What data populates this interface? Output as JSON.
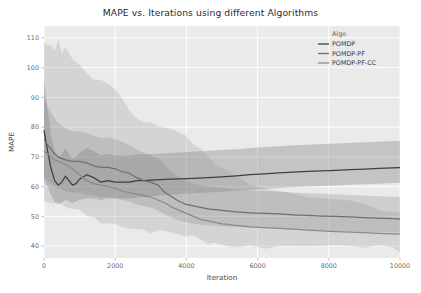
{
  "chart_data": {
    "type": "line",
    "title": "MAPE vs. Iterations using different Algorithms",
    "xlabel": "Iteration",
    "ylabel": "MAPE",
    "xlim": [
      0,
      10000
    ],
    "ylim": [
      36,
      114
    ],
    "xticks": [
      0,
      2000,
      4000,
      6000,
      8000,
      10000
    ],
    "xtick_labels": [
      "0",
      "2000",
      "4000",
      "6000",
      "8000",
      "10000"
    ],
    "yticks": [
      40,
      50,
      60,
      70,
      80,
      90,
      100,
      110
    ],
    "ytick_labels": [
      "40",
      "50",
      "60",
      "70",
      "80",
      "90",
      "100",
      "110"
    ],
    "grid": true,
    "legend_position": "top-right",
    "legend_title": "Algo",
    "background": "#eaeaea",
    "gridline_color": "#ffffff",
    "series": [
      {
        "name": "POMDP",
        "color": "#3f3f3f",
        "x": [
          0,
          100,
          200,
          300,
          400,
          500,
          600,
          700,
          800,
          900,
          1000,
          1200,
          1400,
          1600,
          1800,
          2000,
          2200,
          2400,
          2600,
          2800,
          3000,
          3400,
          3800,
          4200,
          4600,
          5000,
          5400,
          5800,
          6200,
          6600,
          7000,
          7400,
          7800,
          8200,
          8600,
          9000,
          9400,
          9800,
          10000
        ],
        "values": [
          79,
          72,
          66,
          62,
          60.5,
          61.5,
          63.5,
          62,
          60.5,
          61,
          62.5,
          64,
          63,
          61.5,
          62,
          61.5,
          61.5,
          61.5,
          62,
          62,
          62.2,
          62.4,
          62.6,
          62.8,
          63,
          63.3,
          63.6,
          64,
          64.3,
          64.6,
          64.9,
          65.1,
          65.3,
          65.5,
          65.7,
          65.9,
          66.1,
          66.3,
          66.4
        ],
        "band_lower": [
          62,
          60,
          57,
          55,
          54,
          54.5,
          55.5,
          55,
          54.5,
          55,
          55.5,
          56,
          56,
          55.5,
          56,
          56,
          56,
          56,
          56.3,
          56.5,
          56.8,
          57.2,
          57.5,
          57.8,
          58,
          58.3,
          58.6,
          58.9,
          59.2,
          59.5,
          59.8,
          60,
          60.2,
          60.4,
          60.6,
          60.8,
          61,
          61.2,
          61.3
        ],
        "band_upper": [
          96,
          86,
          77,
          72,
          70,
          71,
          73,
          71,
          69.5,
          70,
          71.5,
          73,
          72,
          70.5,
          71,
          70.5,
          70.5,
          70.5,
          70.8,
          70.9,
          71,
          71.2,
          71.5,
          71.8,
          72,
          72.3,
          72.6,
          73,
          73.3,
          73.6,
          73.9,
          74.1,
          74.3,
          74.5,
          74.7,
          74.9,
          75.1,
          75.3,
          75.4
        ]
      },
      {
        "name": "POMDP-PF",
        "color": "#6f6f6f",
        "x": [
          0,
          100,
          200,
          300,
          400,
          500,
          600,
          800,
          1000,
          1200,
          1400,
          1600,
          1800,
          2000,
          2200,
          2400,
          2600,
          2800,
          3000,
          3200,
          3400,
          3600,
          3800,
          4000,
          4200,
          4400,
          4600,
          5000,
          5400,
          5800,
          6200,
          6600,
          7000,
          7400,
          7800,
          8200,
          8600,
          9000,
          9400,
          9800,
          10000
        ],
        "values": [
          76,
          74,
          72.5,
          71,
          70,
          69.5,
          69,
          68.5,
          68.5,
          68,
          67,
          66.5,
          66.5,
          66,
          65,
          64.5,
          63,
          62,
          61.5,
          60.5,
          58,
          56.5,
          55,
          54,
          53.5,
          53,
          52.5,
          52,
          51.5,
          51.2,
          51,
          50.8,
          50.5,
          50.3,
          50.1,
          50,
          49.8,
          49.6,
          49.4,
          49.2,
          49.1
        ],
        "band_lower": [
          63,
          62,
          61,
          60,
          59.5,
          59,
          58.5,
          58,
          58,
          57.5,
          57,
          56.5,
          56.5,
          56,
          55.5,
          55,
          54,
          53.5,
          53,
          52,
          50.5,
          49.5,
          48.5,
          48,
          47.5,
          47.2,
          47,
          46.7,
          46.4,
          46.2,
          46,
          45.8,
          45.6,
          45.4,
          45.2,
          45,
          44.9,
          44.8,
          44.7,
          44.6,
          44.5
        ],
        "band_upper": [
          90,
          87,
          85,
          83,
          81.5,
          80.5,
          79.5,
          78.5,
          78.5,
          78,
          77,
          76.5,
          76.5,
          76,
          75,
          74,
          72.5,
          71.5,
          70.5,
          69.5,
          67,
          65,
          63,
          62,
          61,
          60.5,
          60,
          59.5,
          59,
          58.7,
          58.5,
          58.3,
          58,
          57.8,
          57.6,
          57.4,
          57.2,
          57,
          56.8,
          56.6,
          56.5
        ]
      },
      {
        "name": "POMDP-PF-CC",
        "color": "#8a8a8a",
        "x": [
          0,
          100,
          200,
          300,
          400,
          500,
          600,
          800,
          1000,
          1200,
          1400,
          1600,
          1800,
          2000,
          2200,
          2400,
          2600,
          2800,
          3000,
          3200,
          3400,
          3600,
          3800,
          4000,
          4200,
          4400,
          4600,
          4800,
          5000,
          5400,
          5800,
          6200,
          6600,
          7000,
          7400,
          7800,
          8200,
          8600,
          9000,
          9400,
          9800,
          10000
        ],
        "values": [
          72,
          71,
          70,
          69,
          68.5,
          68,
          67.5,
          66,
          64,
          62,
          61,
          60.5,
          60,
          59.5,
          58.5,
          58,
          57.5,
          57,
          56.5,
          55.5,
          54.5,
          53,
          52,
          51,
          50,
          49,
          48.5,
          48,
          47.5,
          47,
          46.5,
          46.2,
          46,
          45.7,
          45.4,
          45.1,
          44.9,
          44.7,
          44.5,
          44.3,
          44.1,
          44.0
        ],
        "band_lower": [
          56,
          55.5,
          55,
          54.5,
          54,
          53.5,
          53,
          52,
          51,
          50,
          49.5,
          49,
          48.5,
          48,
          47.5,
          47,
          46.5,
          46,
          45.5,
          45,
          44.5,
          44,
          43.5,
          43,
          42.5,
          42,
          41.8,
          41.5,
          41.2,
          40.9,
          40.7,
          40.5,
          40.3,
          40.1,
          39.9,
          39.7,
          39.6,
          39.5,
          39.4,
          39.3,
          39.2,
          39.1
        ],
        "band_upper": [
          110,
          109,
          107,
          105,
          108,
          104,
          106,
          102,
          100,
          99,
          97,
          96,
          95,
          94,
          90,
          86,
          83,
          81,
          80,
          79.5,
          79,
          78.5,
          78,
          77,
          75,
          73,
          71,
          69,
          67,
          64,
          62,
          60,
          58.5,
          57,
          56,
          55,
          54.5,
          54,
          53.5,
          53,
          52.5,
          52.2
        ]
      }
    ]
  },
  "legend": {
    "title": "Algo",
    "items": [
      {
        "label": "POMDP",
        "color": "#3f3f3f"
      },
      {
        "label": "POMDP-PF",
        "color": "#6f6f6f"
      },
      {
        "label": "POMDP-PF-CC",
        "color": "#8a8a8a"
      }
    ]
  }
}
